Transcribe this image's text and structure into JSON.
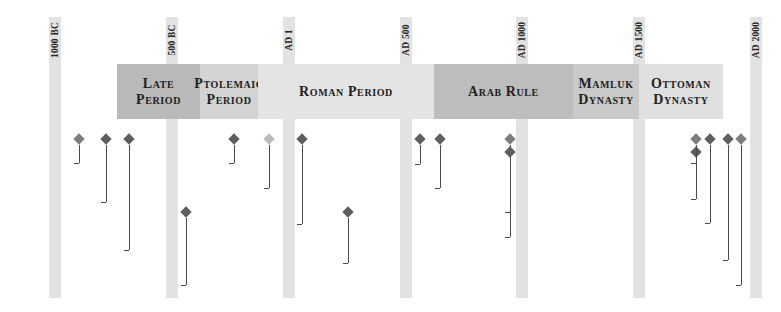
{
  "year_markers": [
    {
      "label": "1000 BC",
      "x": 49
    },
    {
      "label": "500 BC",
      "x": 166
    },
    {
      "label": "AD 1",
      "x": 283
    },
    {
      "label": "AD 500",
      "x": 400
    },
    {
      "label": "AD 1000",
      "x": 516
    },
    {
      "label": "AD 1500",
      "x": 633
    },
    {
      "label": "AD 2000",
      "x": 750
    }
  ],
  "periods": [
    {
      "line1": "Late",
      "line2": "Period",
      "x": 117,
      "w": 83,
      "color": "#b9b9b9"
    },
    {
      "line1": "Ptolemaic",
      "line2": "Period",
      "x": 200,
      "w": 58,
      "color": "#d3d3d3"
    },
    {
      "line1": "Roman Period",
      "line2": "",
      "x": 258,
      "w": 176,
      "color": "#e4e4e4"
    },
    {
      "line1": "Arab Rule",
      "line2": "",
      "x": 434,
      "w": 139,
      "color": "#bdbdbd"
    },
    {
      "line1": "Mamluk",
      "line2": "Dynasty",
      "x": 573,
      "w": 66,
      "color": "#c9c9c9"
    },
    {
      "line1": "Ottoman",
      "line2": "Dynasty",
      "x": 639,
      "w": 84,
      "color": "#e0e0e0"
    }
  ],
  "events": [
    {
      "line1": "3rd Intermediate",
      "line2": "Period",
      "line3": "",
      "dx": 79,
      "dy": 135,
      "ly": 144,
      "ty": 163,
      "color": "#7d7d7d"
    },
    {
      "line1": "Ironworking comes",
      "line2": "to Egypt",
      "line3": "",
      "dx": 106,
      "dy": 135,
      "ly": 183,
      "ty": 202,
      "color": "#5e5e5e"
    },
    {
      "line1": "Greek statues",
      "line2": "(kouroi) influenced by",
      "line3": "Egyptian sculpture",
      "dx": 129,
      "dy": 135,
      "ly": 219,
      "ty": 250,
      "color": "#5e5e5e"
    },
    {
      "line1": "Herodotus visits",
      "line2": "Egypt",
      "line3": "",
      "dx": 186,
      "dy": 208,
      "ly": 268,
      "ty": 285,
      "color": "#5e5e5e"
    },
    {
      "line1": "Rosetta stone",
      "line2": "inscribed",
      "line3": "",
      "dx": 234,
      "dy": 135,
      "ly": 144,
      "ty": 163,
      "color": "#5e5e5e"
    },
    {
      "line1": "Cleopatra VII",
      "line2": "",
      "line3": "",
      "dx": 269,
      "dy": 135,
      "ly": 182,
      "ty": 188,
      "color": "#bcbcbc"
    },
    {
      "line1": "Temple of Isis built",
      "line2": "in Rome",
      "line3": "",
      "dx": 302,
      "dy": 135,
      "ly": 205,
      "ty": 224,
      "color": "#5e5e5e"
    },
    {
      "line1": "St. Anthony's",
      "line2": "monastery founded",
      "line3": "",
      "dx": 348,
      "dy": 208,
      "ly": 244,
      "ty": 263,
      "color": "#5e5e5e"
    },
    {
      "line1": "Justinian suppression",
      "line2": "of Egyptian religion",
      "line3": "",
      "dx": 420,
      "dy": 135,
      "ly": 145,
      "ty": 164,
      "color": "#5e5e5e"
    },
    {
      "line1": "Islam introduced",
      "line2": "",
      "line3": "",
      "dx": 440,
      "dy": 135,
      "ly": 182,
      "ty": 188,
      "color": "#5e5e5e"
    },
    {
      "line1": "Fatimid dynasty",
      "line2": "",
      "line3": "",
      "dx": 510,
      "dy": 135,
      "ly": 206,
      "ty": 212,
      "color": "#7d7d7d"
    },
    {
      "line1": "Foundation of Cairo",
      "line2": "",
      "line3": "",
      "dx": 510,
      "dy": 148,
      "ly": 231,
      "ty": 237,
      "color": "#5e5e5e"
    },
    {
      "line1": "Napoleon's expedition",
      "line2": "to Egypt",
      "line3": "",
      "dx": 696,
      "dy": 148,
      "ly": 150,
      "ty": 163,
      "color": "#5e5e5e"
    },
    {
      "line1": "Rosetta stone",
      "line2": "deciphered",
      "line3": "",
      "dx": 696,
      "dy": 135,
      "ly": 186,
      "ty": 199,
      "color": "#7d7d7d"
    },
    {
      "line1": "Suez canal opened",
      "line2": "",
      "line3": "",
      "dx": 710,
      "dy": 135,
      "ly": 217,
      "ty": 223,
      "color": "#5e5e5e"
    },
    {
      "line1": "Tutankhamun's tomb",
      "line2": "discovered",
      "line3": "",
      "dx": 728,
      "dy": 135,
      "ly": 242,
      "ty": 260,
      "color": "#5e5e5e"
    },
    {
      "line1": "Republic proclaimed",
      "line2": "",
      "line3": "",
      "dx": 741,
      "dy": 135,
      "ly": 279,
      "ty": 285,
      "color": "#7d7d7d"
    }
  ]
}
